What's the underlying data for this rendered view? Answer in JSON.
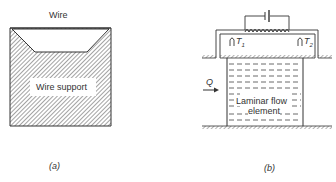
{
  "panel_a": {
    "wire_label": "Wire",
    "support_label": "Wire support",
    "caption": "(a)"
  },
  "panel_b": {
    "flow_label": "Q",
    "element_label_line1": "Laminar flow",
    "element_label_line2": "element",
    "thermocouple_1": "T",
    "thermocouple_1_sub": "1",
    "thermocouple_2": "T",
    "thermocouple_2_sub": "2",
    "caption": "(b)"
  },
  "colors": {
    "line": "#333333",
    "hatch": "#555555",
    "background": "#ffffff"
  }
}
